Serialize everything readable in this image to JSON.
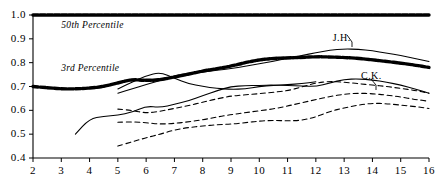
{
  "chart_data": {
    "type": "line",
    "title": "",
    "xlabel": "",
    "ylabel": "",
    "xlim": [
      2,
      16
    ],
    "ylim": [
      0.4,
      1.0
    ],
    "grid": false,
    "legend_position": "inline-annotations",
    "x_ticks": [
      "2",
      "3",
      "4",
      "5",
      "6",
      "7",
      "8",
      "9",
      "10",
      "11",
      "12",
      "13",
      "14",
      "15",
      "16"
    ],
    "y_ticks": [
      "0.4",
      "0.5",
      "0.6",
      "0.7",
      "0.8",
      "0.9",
      "1.0"
    ],
    "annotations": [
      {
        "name": "50th Percentile",
        "x": 3.0,
        "y": 0.955
      },
      {
        "name": "3rd Percentile",
        "x": 3.0,
        "y": 0.775
      },
      {
        "name": "J.H.",
        "x": 12.6,
        "y": 0.905
      },
      {
        "name": "C.K.",
        "x": 13.6,
        "y": 0.745
      }
    ],
    "series": [
      {
        "name": "50th Percentile",
        "style": "thick-dotted",
        "x": [
          2,
          3,
          4,
          5,
          6,
          7,
          8,
          9,
          10,
          11,
          12,
          13,
          14,
          15,
          16
        ],
        "values": [
          1.0,
          1.0,
          1.0,
          1.0,
          1.0,
          1.0,
          1.0,
          1.0,
          1.0,
          1.0,
          1.0,
          1.0,
          1.0,
          1.0,
          1.0
        ]
      },
      {
        "name": "3rd Percentile",
        "style": "thick-dotted",
        "x": [
          2,
          2.5,
          3,
          3.5,
          4,
          4.5,
          5,
          5.5,
          6,
          6.5,
          7,
          7.5,
          8,
          8.5,
          9,
          9.5,
          10,
          10.5,
          11,
          11.5,
          12,
          12.5,
          13,
          13.5,
          14,
          14.5,
          15,
          15.5,
          16
        ],
        "values": [
          0.7,
          0.695,
          0.69,
          0.69,
          0.693,
          0.7,
          0.715,
          0.73,
          0.725,
          0.728,
          0.74,
          0.752,
          0.765,
          0.775,
          0.785,
          0.8,
          0.812,
          0.818,
          0.82,
          0.822,
          0.825,
          0.824,
          0.822,
          0.818,
          0.812,
          0.805,
          0.798,
          0.79,
          0.78
        ]
      },
      {
        "name": "J.H.",
        "style": "solid",
        "x": [
          5,
          5.5,
          6,
          6.5,
          7,
          7.5,
          8,
          8.5,
          9,
          9.5,
          10,
          10.5,
          11,
          11.5,
          12,
          12.5,
          13,
          13.5,
          14,
          14.5,
          15,
          15.5,
          16
        ],
        "values": [
          0.672,
          0.69,
          0.708,
          0.725,
          0.745,
          0.755,
          0.76,
          0.768,
          0.775,
          0.785,
          0.795,
          0.806,
          0.818,
          0.83,
          0.842,
          0.852,
          0.858,
          0.856,
          0.85,
          0.84,
          0.83,
          0.818,
          0.805
        ]
      },
      {
        "name": "C.K.",
        "style": "solid",
        "x": [
          3.5,
          4,
          4.5,
          5,
          5.5,
          6,
          6.5,
          7,
          7.5,
          8,
          8.5,
          9,
          9.5,
          10,
          10.5,
          11,
          11.5,
          12,
          12.5,
          13,
          13.5,
          14,
          14.5,
          15,
          15.5,
          16
        ],
        "values": [
          0.5,
          0.565,
          0.575,
          0.58,
          0.592,
          0.618,
          0.612,
          0.625,
          0.64,
          0.662,
          0.682,
          0.7,
          0.703,
          0.705,
          0.706,
          0.704,
          0.702,
          0.7,
          0.715,
          0.73,
          0.732,
          0.728,
          0.718,
          0.706,
          0.69,
          0.672
        ]
      },
      {
        "name": "solid-peak-series",
        "style": "solid",
        "x": [
          5,
          5.5,
          6,
          6.5,
          7,
          7.5,
          8,
          8.5,
          9,
          9.5,
          10,
          10.5,
          11,
          11.5,
          12
        ],
        "values": [
          0.69,
          0.718,
          0.745,
          0.76,
          0.735,
          0.712,
          0.7,
          0.692,
          0.688,
          0.69,
          0.7,
          0.705,
          0.708,
          0.712,
          0.72
        ]
      },
      {
        "name": "dashed-series-upper",
        "style": "dashed",
        "x": [
          5,
          5.5,
          6,
          6.5,
          7,
          7.5,
          8,
          8.5,
          9,
          9.5,
          10,
          10.5,
          11,
          11.5,
          12,
          12.5,
          13,
          13.5,
          14,
          14.5,
          15,
          15.5,
          16
        ],
        "values": [
          0.605,
          0.6,
          0.588,
          0.596,
          0.608,
          0.62,
          0.634,
          0.648,
          0.66,
          0.665,
          0.67,
          0.676,
          0.682,
          0.698,
          0.715,
          0.722,
          0.718,
          0.712,
          0.706,
          0.7,
          0.692,
          0.684,
          0.672
        ]
      },
      {
        "name": "dashed-series-middle",
        "style": "dashed",
        "x": [
          5,
          5.5,
          6,
          6.5,
          7,
          7.5,
          8,
          8.5,
          9,
          9.5,
          10,
          10.5,
          11,
          11.5,
          12,
          12.5,
          13,
          13.5,
          14,
          14.5,
          15,
          15.5,
          16
        ],
        "values": [
          0.55,
          0.552,
          0.548,
          0.542,
          0.545,
          0.552,
          0.56,
          0.572,
          0.582,
          0.59,
          0.598,
          0.606,
          0.618,
          0.632,
          0.645,
          0.658,
          0.668,
          0.672,
          0.67,
          0.664,
          0.656,
          0.646,
          0.638
        ]
      },
      {
        "name": "dashed-series-lower",
        "style": "dashed",
        "x": [
          5,
          5.5,
          6,
          6.5,
          7,
          7.5,
          8,
          8.5,
          9,
          9.5,
          10,
          10.5,
          11,
          11.5,
          12,
          12.5,
          13,
          13.5,
          14,
          14.5,
          15,
          15.5,
          16
        ],
        "values": [
          0.45,
          0.468,
          0.485,
          0.5,
          0.518,
          0.528,
          0.534,
          0.54,
          0.542,
          0.548,
          0.555,
          0.558,
          0.556,
          0.558,
          0.572,
          0.596,
          0.61,
          0.622,
          0.63,
          0.628,
          0.622,
          0.616,
          0.608
        ]
      }
    ],
    "colors": {
      "axis": "#000000",
      "curve": "#000000",
      "background": "#ffffff"
    }
  }
}
